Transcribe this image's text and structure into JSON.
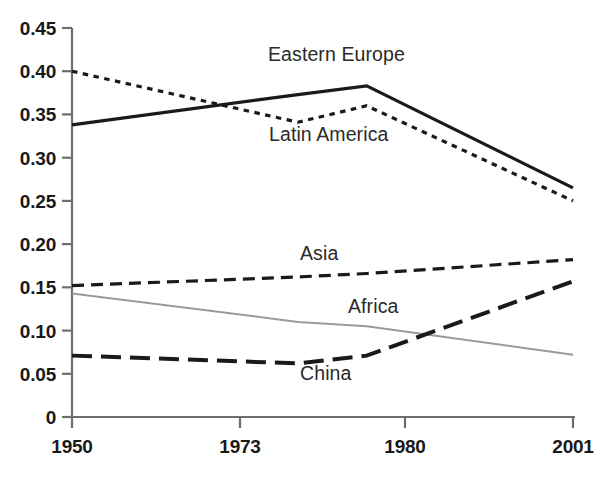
{
  "chart_data": {
    "type": "line",
    "title": "",
    "xlabel": "",
    "ylabel": "",
    "x": [
      1950,
      1973,
      1980,
      2001
    ],
    "x_tick_labels": [
      "1950",
      "1973",
      "1980",
      "2001"
    ],
    "y_tick_labels": [
      "0",
      "0.05",
      "0.10",
      "0.15",
      "0.20",
      "0.25",
      "0.30",
      "0.35",
      "0.40",
      "0.45"
    ],
    "y_ticks": [
      0,
      0.05,
      0.1,
      0.15,
      0.2,
      0.25,
      0.3,
      0.35,
      0.4,
      0.45
    ],
    "ylim": [
      0,
      0.45
    ],
    "xlim": [
      1950,
      2001
    ],
    "grid": false,
    "legend": "inline-labels",
    "series": [
      {
        "name": "Eastern Europe",
        "label": "Eastern Europe",
        "style": "solid",
        "color": "#1a1a1a",
        "width": 3.2,
        "values": [
          0.338,
          0.373,
          0.383,
          0.265
        ]
      },
      {
        "name": "Latin America",
        "label": "Latin America",
        "style": "dotted",
        "color": "#1a1a1a",
        "width": 3.2,
        "values": [
          0.4,
          0.341,
          0.36,
          0.25
        ]
      },
      {
        "name": "Asia",
        "label": "Asia",
        "style": "dashed",
        "color": "#1a1a1a",
        "width": 3.2,
        "values": [
          0.152,
          0.162,
          0.166,
          0.182
        ]
      },
      {
        "name": "Africa",
        "label": "Africa",
        "style": "solid-thin",
        "color": "#9a9a9a",
        "width": 2.0,
        "values": [
          0.143,
          0.11,
          0.105,
          0.072
        ]
      },
      {
        "name": "China",
        "label": "China",
        "style": "long-dash",
        "color": "#1a1a1a",
        "width": 4.0,
        "values": [
          0.071,
          0.062,
          0.071,
          0.157
        ]
      }
    ],
    "annotations": [
      {
        "text": "Eastern Europe",
        "x": 268,
        "y": 44
      },
      {
        "text": "Latin America",
        "x": 268,
        "y": 124
      },
      {
        "text": "Asia",
        "x": 300,
        "y": 243
      },
      {
        "text": "Africa",
        "x": 348,
        "y": 296
      },
      {
        "text": "China",
        "x": 300,
        "y": 363
      }
    ],
    "axis_color": "#6e6e6e"
  }
}
